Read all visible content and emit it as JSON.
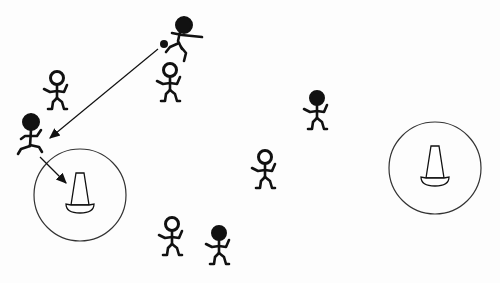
{
  "diagram": {
    "type": "soccer-drill",
    "colors": {
      "ink": "#111111",
      "background": "#fdfdfd",
      "circle": "#333333"
    },
    "zones": [
      {
        "id": "left-zone",
        "cx": 80,
        "cy": 195,
        "r": 46,
        "cone": {
          "x": 80,
          "y": 193
        }
      },
      {
        "id": "right-zone",
        "cx": 435,
        "cy": 168,
        "r": 46,
        "cone": {
          "x": 435,
          "y": 166
        }
      }
    ],
    "ball": {
      "x": 164,
      "y": 44
    },
    "players": [
      {
        "id": "kicker",
        "team": "dark",
        "x": 184,
        "y": 25,
        "pose": "kicking"
      },
      {
        "id": "p2",
        "team": "light",
        "x": 170,
        "y": 70,
        "pose": "standing"
      },
      {
        "id": "p3",
        "team": "light",
        "x": 57,
        "y": 78,
        "pose": "standing"
      },
      {
        "id": "runner",
        "team": "dark",
        "x": 31,
        "y": 122,
        "pose": "running"
      },
      {
        "id": "p5",
        "team": "dark",
        "x": 317,
        "y": 98,
        "pose": "standing"
      },
      {
        "id": "p6",
        "team": "light",
        "x": 265,
        "y": 157,
        "pose": "standing"
      },
      {
        "id": "p7",
        "team": "light",
        "x": 172,
        "y": 224,
        "pose": "standing"
      },
      {
        "id": "p8",
        "team": "dark",
        "x": 219,
        "y": 233,
        "pose": "standing"
      }
    ],
    "arrows": [
      {
        "id": "pass",
        "from": [
          158,
          49
        ],
        "to": [
          50,
          138
        ]
      },
      {
        "id": "run",
        "from": [
          40,
          157
        ],
        "to": [
          66,
          183
        ]
      }
    ]
  }
}
